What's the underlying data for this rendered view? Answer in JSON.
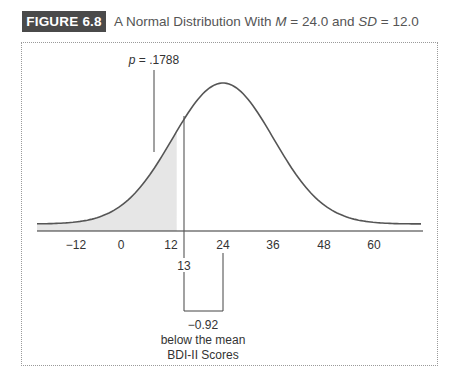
{
  "figure": {
    "badge": "FIGURE 6.8",
    "title_prefix": "A Normal Distribution With ",
    "title_m_var": "M",
    "title_m_eq": " = 24.0 and ",
    "title_sd_var": "SD",
    "title_sd_eq": " = 12.0"
  },
  "annotations": {
    "p_label_var": "p",
    "p_label_value": " = .1788",
    "score_marker": "13",
    "z_value": "−0.92",
    "z_desc": "below the mean",
    "xlabel": "BDI-II Scores"
  },
  "ticks": [
    "−12",
    "0",
    "12",
    "24",
    "36",
    "48",
    "60"
  ],
  "colors": {
    "badge_bg": "#4a4a4a",
    "curve": "#555555",
    "shade": "#e6e6e6",
    "frame": "#9a9a9a"
  },
  "chart_data": {
    "type": "area",
    "title": "A Normal Distribution With M = 24.0 and SD = 12.0",
    "distribution": "normal",
    "mean": 24.0,
    "sd": 12.0,
    "xlabel": "BDI-II Scores",
    "ylabel": "",
    "x_ticks": [
      -12,
      0,
      12,
      24,
      36,
      48,
      60
    ],
    "xlim": [
      -21,
      69
    ],
    "shaded_region": {
      "from": "-inf",
      "to": 13,
      "p": 0.1788
    },
    "annotations": [
      {
        "text": "p = .1788",
        "target": "shaded area left of 13"
      },
      {
        "text": "13",
        "x": 13
      },
      {
        "text": "−0.92 below the mean",
        "span": [
          13,
          24
        ]
      }
    ],
    "grid": false,
    "legend": false
  }
}
